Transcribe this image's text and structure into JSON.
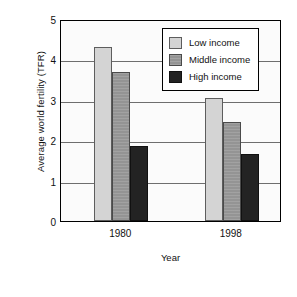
{
  "chart_data": {
    "type": "bar",
    "title": "",
    "xlabel": "Year",
    "ylabel": "Average world fertility (TFR)",
    "categories": [
      "1980",
      "1998"
    ],
    "series": [
      {
        "name": "Low income",
        "values": [
          4.3,
          3.05
        ],
        "color": "#d4d4d4"
      },
      {
        "name": "Middle income",
        "values": [
          3.7,
          2.45
        ],
        "color": "#949494"
      },
      {
        "name": "High income",
        "values": [
          1.85,
          1.65
        ],
        "color": "#232323"
      }
    ],
    "ylim": [
      0,
      5
    ],
    "yticks": [
      "5",
      "4",
      "3",
      "2",
      "1",
      "0"
    ],
    "ytick_values": [
      5,
      4,
      3,
      2,
      1,
      0
    ],
    "grid": true,
    "legend_position": "upper right"
  },
  "legend": {
    "entries": [
      {
        "label": "Low income"
      },
      {
        "label": "Middle income"
      },
      {
        "label": "High income"
      }
    ]
  }
}
